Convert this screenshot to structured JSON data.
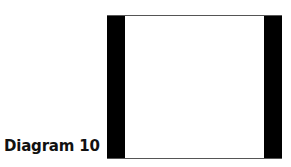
{
  "caption": "Diagram 10",
  "diagram": {
    "shape": "rectangle",
    "fill": "#ffffff",
    "bars": [
      {
        "side": "left",
        "color": "#000000"
      },
      {
        "side": "right",
        "color": "#000000"
      }
    ]
  }
}
